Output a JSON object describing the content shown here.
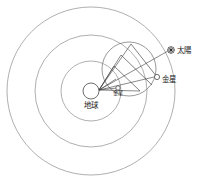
{
  "diagram": {
    "title": "",
    "background_color": "#ffffff",
    "line_color": "#8d8d8d",
    "accent_color": "#2f2f2f",
    "center_body": {
      "name_label": "地球",
      "marker": "open-circle",
      "cx": 91,
      "cy": 91,
      "r": 8
    },
    "orbits": [
      {
        "name": "inner-deferent",
        "cx": 91,
        "cy": 91,
        "r": 30
      },
      {
        "name": "middle-deferent",
        "cx": 91,
        "cy": 91,
        "r": 56
      },
      {
        "name": "outer-deferent",
        "cx": 91,
        "cy": 91,
        "r": 84
      }
    ],
    "epicycle": {
      "name": "venus-epicycle",
      "cx": 129,
      "cy": 69,
      "r": 27
    },
    "bodies": [
      {
        "id": "sun",
        "name_label": "太陽",
        "marker": "star-circle",
        "cx": 171,
        "cy": 50,
        "r": 3.3,
        "label_x": 177,
        "label_y": 53
      },
      {
        "id": "venus",
        "name_label": "金星",
        "marker": "open-circle",
        "cx": 157,
        "cy": 77,
        "r": 2.6,
        "label_x": 162,
        "label_y": 82
      }
    ],
    "inner_marker": {
      "name_label": "金星",
      "cx": 118,
      "cy": 88,
      "r": 2.2,
      "label_x": 114,
      "label_y": 94
    },
    "sight_lines": [
      {
        "from": "earth",
        "to": "sun",
        "x1": 99,
        "y1": 90,
        "x2": 168,
        "y2": 51
      },
      {
        "from": "earth",
        "to": "venus-outer",
        "x1": 99,
        "y1": 90,
        "x2": 154,
        "y2": 77
      },
      {
        "from": "earth",
        "to": "epicycle-top",
        "x1": 99,
        "y1": 90,
        "x2": 131,
        "y2": 44
      },
      {
        "from": "earth",
        "to": "epicycle-upper",
        "x1": 99,
        "y1": 90,
        "x2": 121,
        "y2": 55
      },
      {
        "from": "earth",
        "to": "epicycle-left",
        "x1": 99,
        "y1": 90,
        "x2": 114,
        "y2": 66
      },
      {
        "from": "earth",
        "to": "epicycle-mid",
        "x1": 99,
        "y1": 90,
        "x2": 116,
        "y2": 79
      },
      {
        "from": "earth",
        "to": "inner-venus",
        "x1": 99,
        "y1": 90,
        "x2": 117,
        "y2": 88
      },
      {
        "from": "earth",
        "to": "lower-right",
        "x1": 99,
        "y1": 90,
        "x2": 140,
        "y2": 91
      }
    ],
    "chords": [
      {
        "name": "epicycle-chord-a",
        "x1": 131,
        "y1": 44,
        "x2": 157,
        "y2": 77
      },
      {
        "name": "epicycle-chord-b",
        "x1": 114,
        "y1": 66,
        "x2": 140,
        "y2": 91
      },
      {
        "name": "epicycle-chord-c",
        "x1": 121,
        "y1": 55,
        "x2": 152,
        "y2": 85
      }
    ]
  }
}
